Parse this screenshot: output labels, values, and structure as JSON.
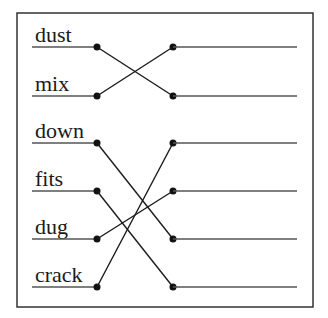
{
  "diagram": {
    "type": "matching-exercise",
    "left_words": [
      "dust",
      "mix",
      "down",
      "fits",
      "dug",
      "crack"
    ],
    "right_slots": [
      "",
      "",
      "",
      "",
      "",
      ""
    ],
    "connections": [
      {
        "from": "dust",
        "from_index": 0,
        "to_index": 1
      },
      {
        "from": "mix",
        "from_index": 1,
        "to_index": 0
      },
      {
        "from": "down",
        "from_index": 2,
        "to_index": 4
      },
      {
        "from": "fits",
        "from_index": 3,
        "to_index": 5
      },
      {
        "from": "dug",
        "from_index": 4,
        "to_index": 3
      },
      {
        "from": "crack",
        "from_index": 5,
        "to_index": 2
      }
    ]
  }
}
